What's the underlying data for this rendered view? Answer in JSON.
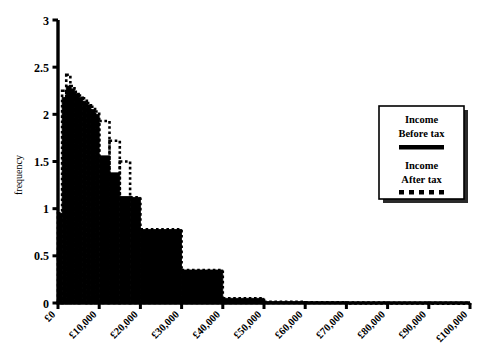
{
  "chart_data": {
    "type": "bar",
    "title": "",
    "subtitle": "",
    "xlabel": "",
    "ylabel": "frequency",
    "xlim": [
      0,
      100000
    ],
    "ylim": [
      0,
      3
    ],
    "grid": false,
    "legend_position": "right",
    "y_ticks": [
      "0",
      "0.5",
      "1",
      "1.5",
      "2",
      "2.5",
      "3"
    ],
    "y_tick_values": [
      0,
      0.5,
      1,
      1.5,
      2,
      2.5,
      3
    ],
    "x_ticks": [
      "£0",
      "£10,000",
      "£20,000",
      "£30,000",
      "£40,000",
      "£50,000",
      "£60,000",
      "£70,000",
      "£80,000",
      "£90,000",
      "£100,000"
    ],
    "x_tick_values": [
      0,
      10000,
      20000,
      30000,
      40000,
      50000,
      60000,
      70000,
      80000,
      90000,
      100000
    ],
    "series": [
      {
        "name": "Income Before tax",
        "style": "solid-fill",
        "color": "#000000",
        "bin_starts": [
          0,
          1000,
          2000,
          3000,
          4000,
          5000,
          6000,
          7000,
          8000,
          9000,
          10000,
          12500,
          15000,
          17500,
          20000,
          30000,
          40000,
          50000,
          60000,
          70000,
          80000,
          90000
        ],
        "bin_ends": [
          1000,
          2000,
          3000,
          4000,
          5000,
          6000,
          7000,
          8000,
          9000,
          10000,
          12500,
          15000,
          17500,
          20000,
          30000,
          40000,
          50000,
          60000,
          70000,
          80000,
          90000,
          100000
        ],
        "values": [
          0.95,
          2.18,
          2.3,
          2.27,
          2.22,
          2.18,
          2.14,
          2.1,
          2.05,
          2.0,
          1.56,
          1.38,
          1.13,
          1.12,
          0.78,
          0.35,
          0.05,
          0.012,
          0.008,
          0.005,
          0.003,
          0.002
        ]
      },
      {
        "name": "Income After tax",
        "style": "dotted-outline",
        "color": "#000000",
        "bin_starts": [
          0,
          1000,
          2000,
          3000,
          4000,
          5000,
          6000,
          7000,
          8000,
          9000,
          10000,
          12500,
          15000,
          17500,
          20000,
          30000,
          40000,
          50000,
          60000,
          70000,
          80000,
          90000
        ],
        "bin_ends": [
          1000,
          2000,
          3000,
          4000,
          5000,
          6000,
          7000,
          8000,
          9000,
          10000,
          12500,
          15000,
          17500,
          20000,
          30000,
          40000,
          50000,
          60000,
          70000,
          80000,
          90000,
          100000
        ],
        "values": [
          0.95,
          2.25,
          2.42,
          2.3,
          2.24,
          2.2,
          2.17,
          2.12,
          2.08,
          2.03,
          1.93,
          1.72,
          1.5,
          1.12,
          0.78,
          0.35,
          0.05,
          0.012,
          0.008,
          0.005,
          0.003,
          0.002
        ]
      }
    ]
  },
  "legend": {
    "entries": [
      {
        "line1": "Income",
        "line2": "Before tax",
        "swatch": "solid-line-swatch"
      },
      {
        "line1": "Income",
        "line2": "After tax",
        "swatch": "dotted-line-swatch"
      }
    ]
  },
  "colors": {
    "axis": "#000000",
    "series_before_tax": "#000000",
    "series_after_tax": "#000000",
    "background": "#ffffff"
  }
}
